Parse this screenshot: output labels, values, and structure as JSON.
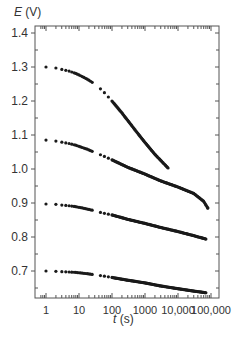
{
  "chart_data": {
    "type": "scatter",
    "title": "",
    "xlabel_var": "t",
    "xlabel_unit": " (s)",
    "ylabel_var": "E",
    "ylabel_unit": " (V)",
    "xscale": "log",
    "xlim": [
      0.6,
      150000
    ],
    "ylim": [
      0.62,
      1.42
    ],
    "x_ticks": [
      1,
      10,
      100,
      1000,
      10000,
      100000
    ],
    "x_tick_labels": [
      "1",
      "10",
      "100",
      "1000",
      "10,000",
      "100,000"
    ],
    "y_ticks": [
      0.7,
      0.8,
      0.9,
      1.0,
      1.1,
      1.2,
      1.3,
      1.4
    ],
    "y_tick_labels": [
      "0.7",
      "0.8",
      "0.9",
      "1.0",
      "1.1",
      "1.2",
      "1.3",
      "1.4"
    ],
    "grid": false,
    "legend": null,
    "series": [
      {
        "name": "series-1",
        "start_E": 1.3,
        "points": [
          [
            1,
            1.3
          ],
          [
            2,
            1.297
          ],
          [
            3,
            1.293
          ],
          [
            5,
            1.288
          ],
          [
            8,
            1.281
          ],
          [
            12,
            1.273
          ],
          [
            18,
            1.264
          ],
          [
            25,
            1.255
          ],
          [
            50,
            1.232
          ],
          [
            100,
            1.2
          ],
          [
            200,
            1.165
          ],
          [
            500,
            1.115
          ],
          [
            1000,
            1.078
          ],
          [
            2000,
            1.043
          ],
          [
            5000,
            1.003
          ]
        ]
      },
      {
        "name": "series-2",
        "start_E": 1.085,
        "points": [
          [
            1,
            1.085
          ],
          [
            2,
            1.082
          ],
          [
            3,
            1.079
          ],
          [
            5,
            1.075
          ],
          [
            8,
            1.07
          ],
          [
            12,
            1.064
          ],
          [
            18,
            1.058
          ],
          [
            25,
            1.052
          ],
          [
            50,
            1.04
          ],
          [
            100,
            1.027
          ],
          [
            300,
            1.005
          ],
          [
            1000,
            0.985
          ],
          [
            3000,
            0.965
          ],
          [
            10000,
            0.947
          ],
          [
            30000,
            0.928
          ],
          [
            60000,
            0.905
          ],
          [
            80000,
            0.885
          ]
        ]
      },
      {
        "name": "series-3",
        "start_E": 0.897,
        "points": [
          [
            1,
            0.897
          ],
          [
            2,
            0.896
          ],
          [
            3,
            0.894
          ],
          [
            5,
            0.892
          ],
          [
            8,
            0.889
          ],
          [
            12,
            0.886
          ],
          [
            18,
            0.882
          ],
          [
            25,
            0.879
          ],
          [
            50,
            0.871
          ],
          [
            100,
            0.865
          ],
          [
            300,
            0.852
          ],
          [
            1000,
            0.84
          ],
          [
            3000,
            0.828
          ],
          [
            10000,
            0.816
          ],
          [
            30000,
            0.804
          ],
          [
            70000,
            0.794
          ]
        ]
      },
      {
        "name": "series-4",
        "start_E": 0.7,
        "points": [
          [
            1,
            0.7
          ],
          [
            2,
            0.699
          ],
          [
            3,
            0.698
          ],
          [
            5,
            0.697
          ],
          [
            8,
            0.696
          ],
          [
            12,
            0.694
          ],
          [
            18,
            0.692
          ],
          [
            25,
            0.69
          ],
          [
            50,
            0.686
          ],
          [
            100,
            0.681
          ],
          [
            300,
            0.673
          ],
          [
            1000,
            0.665
          ],
          [
            3000,
            0.656
          ],
          [
            10000,
            0.648
          ],
          [
            30000,
            0.641
          ],
          [
            70000,
            0.636
          ]
        ]
      }
    ],
    "marker_color": "#1a1a1a",
    "axis_color": "#555555"
  }
}
